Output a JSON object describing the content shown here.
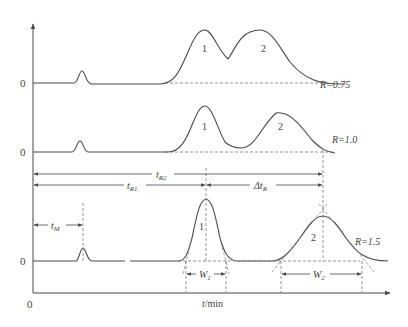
{
  "figure": {
    "type": "chromatogram-resolution-diagram",
    "colors": {
      "line": "#4a4a4a",
      "dashed": "#7a7a7a",
      "text": "#444444",
      "background": "#ffffff"
    }
  },
  "axes": {
    "origin_label": "0",
    "x_label_var": "t",
    "x_label_unit": "/min"
  },
  "traces": [
    {
      "baseline_label": "0",
      "resolution_label": "R=0.75",
      "peak_labels": [
        "1",
        "2"
      ]
    },
    {
      "baseline_label": "0",
      "resolution_label": "R=1.0",
      "peak_labels": [
        "1",
        "2"
      ]
    },
    {
      "baseline_label": "0",
      "resolution_label": "R=1.5",
      "peak_labels": [
        "1",
        "2"
      ]
    }
  ],
  "annotations": {
    "tR2": "t",
    "tR2_sub": "R2",
    "tR1": "t",
    "tR1_sub": "R1",
    "deltaTR": "Δt",
    "deltaTR_sub": "R",
    "tM": "t",
    "tM_sub": "M",
    "W1": "W",
    "W1_sub": "1",
    "W2": "W",
    "W2_sub": "2"
  }
}
